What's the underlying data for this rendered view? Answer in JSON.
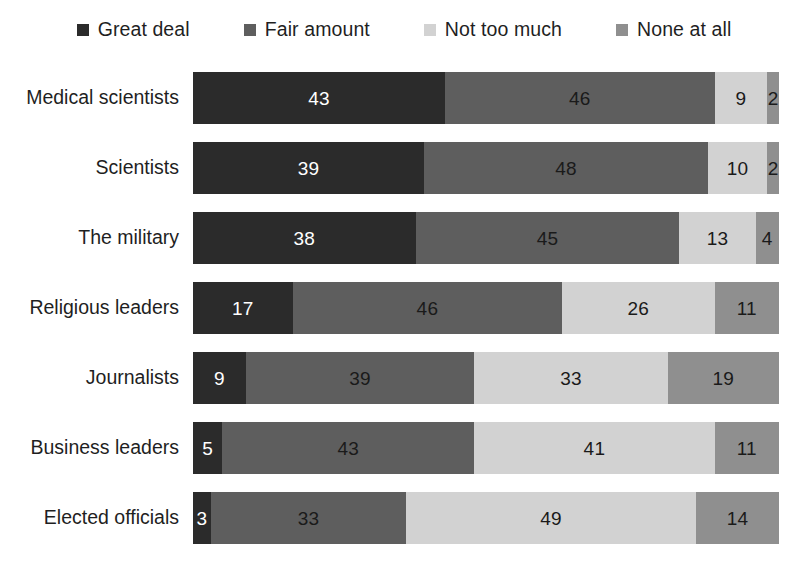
{
  "chart_data": {
    "type": "bar",
    "subtype": "stacked-horizontal-100pct",
    "title": "",
    "subtitle": "",
    "xlabel": "",
    "ylabel": "",
    "xlim": [
      0,
      100
    ],
    "grid": false,
    "legend_position": "top-center",
    "orientation": "horizontal",
    "stacked": true,
    "value_suffix": "%",
    "categories": [
      "Medical scientists",
      "Scientists",
      "The military",
      "Religious leaders",
      "Journalists",
      "Business leaders",
      "Elected officials"
    ],
    "series": [
      {
        "name": "Great deal",
        "color": "#2b2b2b",
        "values": [
          43,
          39,
          38,
          17,
          9,
          5,
          3
        ]
      },
      {
        "name": "Fair amount",
        "color": "#5e5e5e",
        "values": [
          46,
          48,
          45,
          46,
          39,
          43,
          33
        ]
      },
      {
        "name": "Not too much",
        "color": "#d2d2d2",
        "values": [
          9,
          10,
          13,
          26,
          33,
          41,
          49
        ]
      },
      {
        "name": "None at all",
        "color": "#8f8f8f",
        "values": [
          2,
          2,
          4,
          11,
          19,
          11,
          14
        ]
      }
    ],
    "rows": [
      {
        "label": "Medical scientists",
        "segments": [
          {
            "series": "Great deal",
            "value": 43,
            "label": "43",
            "color": "#2b2b2b",
            "text_color": "light",
            "show_label": true
          },
          {
            "series": "Fair amount",
            "value": 46,
            "label": "46",
            "color": "#5e5e5e",
            "text_color": "dark",
            "show_label": true
          },
          {
            "series": "Not too much",
            "value": 9,
            "label": "9",
            "color": "#d2d2d2",
            "text_color": "dark",
            "show_label": true
          },
          {
            "series": "None at all",
            "value": 2,
            "label": "2",
            "color": "#8f8f8f",
            "text_color": "dark",
            "show_label": true
          }
        ]
      },
      {
        "label": "Scientists",
        "segments": [
          {
            "series": "Great deal",
            "value": 39,
            "label": "39",
            "color": "#2b2b2b",
            "text_color": "light",
            "show_label": true
          },
          {
            "series": "Fair amount",
            "value": 48,
            "label": "48",
            "color": "#5e5e5e",
            "text_color": "dark",
            "show_label": true
          },
          {
            "series": "Not too much",
            "value": 10,
            "label": "10",
            "color": "#d2d2d2",
            "text_color": "dark",
            "show_label": true
          },
          {
            "series": "None at all",
            "value": 2,
            "label": "2",
            "color": "#8f8f8f",
            "text_color": "dark",
            "show_label": true
          }
        ]
      },
      {
        "label": "The military",
        "segments": [
          {
            "series": "Great deal",
            "value": 38,
            "label": "38",
            "color": "#2b2b2b",
            "text_color": "light",
            "show_label": true
          },
          {
            "series": "Fair amount",
            "value": 45,
            "label": "45",
            "color": "#5e5e5e",
            "text_color": "dark",
            "show_label": true
          },
          {
            "series": "Not too much",
            "value": 13,
            "label": "13",
            "color": "#d2d2d2",
            "text_color": "dark",
            "show_label": true
          },
          {
            "series": "None at all",
            "value": 4,
            "label": "4",
            "color": "#8f8f8f",
            "text_color": "dark",
            "show_label": true
          }
        ]
      },
      {
        "label": "Religious leaders",
        "segments": [
          {
            "series": "Great deal",
            "value": 17,
            "label": "17",
            "color": "#2b2b2b",
            "text_color": "light",
            "show_label": true
          },
          {
            "series": "Fair amount",
            "value": 46,
            "label": "46",
            "color": "#5e5e5e",
            "text_color": "dark",
            "show_label": true
          },
          {
            "series": "Not too much",
            "value": 26,
            "label": "26",
            "color": "#d2d2d2",
            "text_color": "dark",
            "show_label": true
          },
          {
            "series": "None at all",
            "value": 11,
            "label": "11",
            "color": "#8f8f8f",
            "text_color": "dark",
            "show_label": true
          }
        ]
      },
      {
        "label": "Journalists",
        "segments": [
          {
            "series": "Great deal",
            "value": 9,
            "label": "9",
            "color": "#2b2b2b",
            "text_color": "light",
            "show_label": true
          },
          {
            "series": "Fair amount",
            "value": 39,
            "label": "39",
            "color": "#5e5e5e",
            "text_color": "dark",
            "show_label": true
          },
          {
            "series": "Not too much",
            "value": 33,
            "label": "33",
            "color": "#d2d2d2",
            "text_color": "dark",
            "show_label": true
          },
          {
            "series": "None at all",
            "value": 19,
            "label": "19",
            "color": "#8f8f8f",
            "text_color": "dark",
            "show_label": true
          }
        ]
      },
      {
        "label": "Business leaders",
        "segments": [
          {
            "series": "Great deal",
            "value": 5,
            "label": "5",
            "color": "#2b2b2b",
            "text_color": "light",
            "show_label": true
          },
          {
            "series": "Fair amount",
            "value": 43,
            "label": "43",
            "color": "#5e5e5e",
            "text_color": "dark",
            "show_label": true
          },
          {
            "series": "Not too much",
            "value": 41,
            "label": "41",
            "color": "#d2d2d2",
            "text_color": "dark",
            "show_label": true
          },
          {
            "series": "None at all",
            "value": 11,
            "label": "11",
            "color": "#8f8f8f",
            "text_color": "dark",
            "show_label": true
          }
        ]
      },
      {
        "label": "Elected officials",
        "segments": [
          {
            "series": "Great deal",
            "value": 3,
            "label": "3",
            "color": "#2b2b2b",
            "text_color": "light",
            "show_label": true
          },
          {
            "series": "Fair amount",
            "value": 33,
            "label": "33",
            "color": "#5e5e5e",
            "text_color": "dark",
            "show_label": true
          },
          {
            "series": "Not too much",
            "value": 49,
            "label": "49",
            "color": "#d2d2d2",
            "text_color": "dark",
            "show_label": true
          },
          {
            "series": "None at all",
            "value": 14,
            "label": "14",
            "color": "#8f8f8f",
            "text_color": "dark",
            "show_label": true
          }
        ]
      }
    ]
  },
  "legend": {
    "items": [
      {
        "label": "Great deal",
        "color": "#2b2b2b"
      },
      {
        "label": "Fair amount",
        "color": "#5e5e5e"
      },
      {
        "label": "Not too much",
        "color": "#d2d2d2"
      },
      {
        "label": "None at all",
        "color": "#8f8f8f"
      }
    ]
  },
  "colors": {
    "great_deal": "#2b2b2b",
    "fair_amount": "#5e5e5e",
    "not_too_much": "#d2d2d2",
    "none_at_all": "#8f8f8f",
    "background": "#ffffff",
    "text": "#1f1f1f"
  }
}
